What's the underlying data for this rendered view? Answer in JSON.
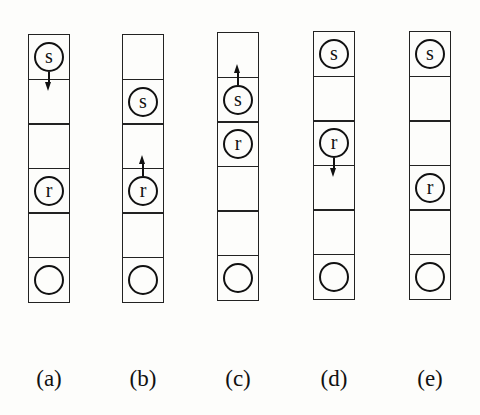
{
  "diagram": {
    "rows_per_column": 6,
    "columns": [
      {
        "label": "(a)",
        "left": 28,
        "top": 34,
        "tokens": [
          {
            "symbol": "s",
            "row": 0,
            "arrow": "down"
          },
          {
            "symbol": "r",
            "row": 3,
            "arrow": "none"
          },
          {
            "symbol": "",
            "row": 5,
            "arrow": "none",
            "type": "goal"
          }
        ]
      },
      {
        "label": "(b)",
        "left": 122,
        "top": 34,
        "tokens": [
          {
            "symbol": "s",
            "row": 1,
            "arrow": "none"
          },
          {
            "symbol": "r",
            "row": 3,
            "arrow": "up"
          },
          {
            "symbol": "",
            "row": 5,
            "arrow": "none",
            "type": "goal"
          }
        ]
      },
      {
        "label": "(c)",
        "left": 217,
        "top": 32,
        "tokens": [
          {
            "symbol": "s",
            "row": 1,
            "arrow": "up"
          },
          {
            "symbol": "r",
            "row": 2,
            "arrow": "none"
          },
          {
            "symbol": "",
            "row": 5,
            "arrow": "none",
            "type": "goal"
          }
        ]
      },
      {
        "label": "(d)",
        "left": 313,
        "top": 31,
        "tokens": [
          {
            "symbol": "s",
            "row": 0,
            "arrow": "none"
          },
          {
            "symbol": "r",
            "row": 2,
            "arrow": "down"
          },
          {
            "symbol": "",
            "row": 5,
            "arrow": "none",
            "type": "goal"
          }
        ]
      },
      {
        "label": "(e)",
        "left": 409,
        "top": 31,
        "tokens": [
          {
            "symbol": "s",
            "row": 0,
            "arrow": "none"
          },
          {
            "symbol": "r",
            "row": 3,
            "arrow": "none"
          },
          {
            "symbol": "",
            "row": 5,
            "arrow": "none",
            "type": "goal"
          }
        ]
      }
    ]
  }
}
